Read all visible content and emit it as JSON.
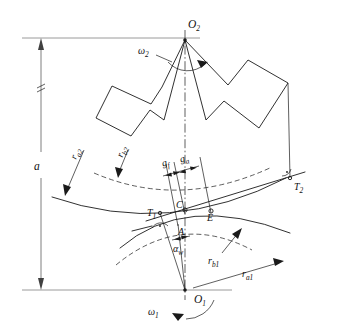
{
  "diagram": {
    "type": "engineering-drawing",
    "centers": {
      "upper": {
        "label": "O",
        "sub": "2",
        "x": 185,
        "y": 38
      },
      "lower": {
        "label": "O",
        "sub": "1",
        "x": 185,
        "y": 290
      }
    },
    "center_distance": {
      "label": "a",
      "description": "centre distance between O1 and O2"
    },
    "angular_velocities": [
      {
        "label": "ω",
        "sub": "2",
        "gear": "upper",
        "direction": "clockwise"
      },
      {
        "label": "ω",
        "sub": "1",
        "gear": "lower",
        "direction": "counter-clockwise"
      }
    ],
    "radii": [
      {
        "label": "r",
        "sub": "a2",
        "name": "addendum-radius-gear2"
      },
      {
        "label": "r",
        "sub": "b2",
        "name": "base-radius-gear2"
      },
      {
        "label": "r",
        "sub": "b1",
        "name": "base-radius-gear1"
      },
      {
        "label": "r",
        "sub": "a1",
        "name": "addendum-radius-gear1"
      }
    ],
    "path_segments": [
      {
        "label": "g",
        "sub": "f",
        "name": "approach-path-length"
      },
      {
        "label": "g",
        "sub": "a",
        "name": "recess-path-length"
      }
    ],
    "points": [
      {
        "label": "T",
        "sub": "1",
        "name": "tangent-point-gear1",
        "x": 160,
        "y": 213
      },
      {
        "label": "A",
        "sub": "",
        "name": "start-of-contact",
        "x": 178,
        "y": 224
      },
      {
        "label": "C",
        "sub": "",
        "name": "pitch-point",
        "x": 185,
        "y": 210
      },
      {
        "label": "E",
        "sub": "",
        "name": "end-of-contact",
        "x": 211,
        "y": 211
      },
      {
        "label": "T",
        "sub": "2",
        "name": "tangent-point-gear2",
        "x": 290,
        "y": 178
      }
    ],
    "angle": {
      "label": "α",
      "sub": "w",
      "name": "working-pressure-angle"
    },
    "right_angle_markers": [
      {
        "at": "T1",
        "name": "right-angle-marker-t1"
      },
      {
        "at": "T2",
        "name": "right-angle-marker-t2"
      }
    ],
    "colors": {
      "line": "#1a1a1a",
      "extension": "#808080",
      "background": "#ffffff"
    }
  }
}
